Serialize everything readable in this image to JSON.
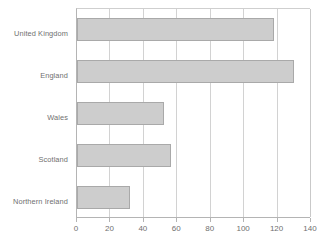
{
  "chart_data": {
    "type": "bar",
    "orientation": "horizontal",
    "title": "",
    "subtitle": "",
    "xlabel": "",
    "ylabel": "",
    "categories": [
      "United Kingdom",
      "England",
      "Wales",
      "Scotland",
      "Northern Ireland"
    ],
    "values": [
      118,
      130,
      52,
      56,
      32
    ],
    "series": [
      {
        "name": "",
        "values": [
          118,
          130,
          52,
          56,
          32
        ]
      }
    ],
    "xlim": [
      0,
      140
    ],
    "xticks": [
      0,
      20,
      40,
      60,
      80,
      100,
      120,
      140
    ],
    "xtick_labels": [
      "0",
      "20",
      "40",
      "60",
      "80",
      "100",
      "120",
      "140"
    ],
    "grid": true,
    "grid_axis": "x",
    "legend": false,
    "legend_position": "none",
    "annotations": [],
    "colors": {
      "bar_fill": "#cdcdcd",
      "bar_border": "#a9a9a9",
      "gridline": "#d2d2d2",
      "axis": "#b4b4b4",
      "text": "#6f6f6f",
      "background": "#ffffff"
    }
  }
}
